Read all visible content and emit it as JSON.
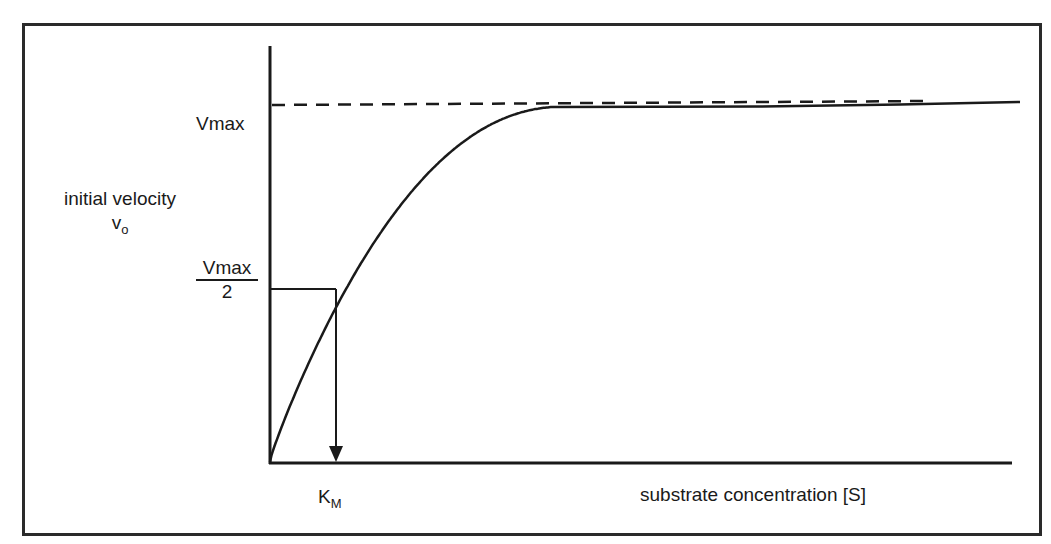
{
  "diagram": {
    "y_axis_label": "initial velocity",
    "y_axis_symbol": "v",
    "y_axis_symbol_subscript": "o",
    "x_axis_label": "substrate concentration [S]",
    "vmax_label": "Vmax",
    "half_vmax_numerator": "Vmax",
    "half_vmax_denominator": "2",
    "km_label": "K",
    "km_subscript": "M",
    "line_color": "#1a1a1a"
  },
  "chart_data": {
    "type": "line",
    "title": "",
    "xlabel": "substrate concentration [S]",
    "ylabel": "initial velocity v_o",
    "series": [
      {
        "name": "v_o = Vmax[S]/(Km+[S])",
        "style": "solid",
        "relative_vmax": 1.0,
        "relative_km": 1.0
      },
      {
        "name": "Vmax asymptote",
        "style": "dashed",
        "relative_y": 1.0
      }
    ],
    "annotations": [
      {
        "label": "Vmax",
        "y_relative": 1.0
      },
      {
        "label": "Vmax/2",
        "y_relative": 0.5
      },
      {
        "label": "K_M",
        "x_relative_to_km": 1.0,
        "marker": "arrow-down"
      }
    ],
    "grid": false
  }
}
